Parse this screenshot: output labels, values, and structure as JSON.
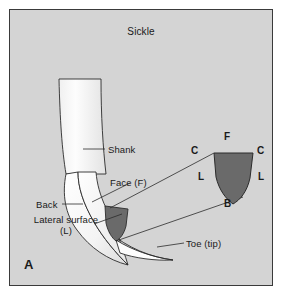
{
  "figure": {
    "panel_letter": "A",
    "title": "Sickle",
    "background_color": "#d4d4d4",
    "border_color": "#3a3a3a",
    "cross_section_fill": "#6a6a6a",
    "blade_fill": "#fbfbfb",
    "line_color": "#2b2b2b"
  },
  "callouts": [
    {
      "id": "shank",
      "label": "Shank"
    },
    {
      "id": "face",
      "label": "Face (F)"
    },
    {
      "id": "back",
      "label": "Back"
    },
    {
      "id": "lateral",
      "label": "Lateral surface (L)"
    },
    {
      "id": "toe",
      "label": "Toe (tip)"
    }
  ],
  "cross_section": {
    "name": "sickle-cross-section",
    "shape": "triangular-shield",
    "labels": {
      "face_top": "F",
      "cutting_edge_left": "C",
      "cutting_edge_right": "C",
      "lateral_left": "L",
      "lateral_right": "L",
      "back_bottom": "B"
    }
  }
}
